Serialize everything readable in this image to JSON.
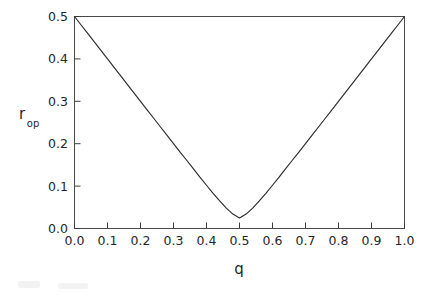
{
  "figure": {
    "background_color": "#ffffff",
    "frame_color": "#4a4a4a",
    "curve_color": "#2b2b2b"
  },
  "chart_data": {
    "type": "line",
    "title": "",
    "subtitle": "",
    "xlabel": "q",
    "ylabel": "r",
    "ylabel_subscript": "op",
    "xlim": [
      0.0,
      1.0
    ],
    "ylim": [
      0.0,
      0.5
    ],
    "grid": false,
    "legend": null,
    "legend_position": "none",
    "xticks": [
      "0.0",
      "0.1",
      "0.2",
      "0.3",
      "0.4",
      "0.5",
      "0.6",
      "0.7",
      "0.8",
      "0.9",
      "1.0"
    ],
    "xtick_values": [
      0.0,
      0.1,
      0.2,
      0.3,
      0.4,
      0.5,
      0.6,
      0.7,
      0.8,
      0.9,
      1.0
    ],
    "yticks": [
      "0.0",
      "0.1",
      "0.2",
      "0.3",
      "0.4",
      "0.5"
    ],
    "ytick_values": [
      0.0,
      0.1,
      0.2,
      0.3,
      0.4,
      0.5
    ],
    "series": [
      {
        "name": "r_op",
        "x": [
          0.0,
          0.02,
          0.04,
          0.06,
          0.08,
          0.1,
          0.12,
          0.14,
          0.16,
          0.18,
          0.2,
          0.22,
          0.24,
          0.26,
          0.28,
          0.3,
          0.32,
          0.34,
          0.36,
          0.38,
          0.4,
          0.42,
          0.44,
          0.46,
          0.48,
          0.5,
          0.52,
          0.54,
          0.56,
          0.58,
          0.6,
          0.62,
          0.64,
          0.66,
          0.68,
          0.7,
          0.72,
          0.74,
          0.76,
          0.78,
          0.8,
          0.82,
          0.84,
          0.86,
          0.88,
          0.9,
          0.92,
          0.94,
          0.96,
          0.98,
          1.0
        ],
        "y": [
          0.5,
          0.48,
          0.46,
          0.44,
          0.42,
          0.4,
          0.38,
          0.36,
          0.34,
          0.32,
          0.3,
          0.28,
          0.26,
          0.24,
          0.22,
          0.2,
          0.18,
          0.161,
          0.141,
          0.121,
          0.102,
          0.083,
          0.065,
          0.048,
          0.034,
          0.025,
          0.034,
          0.048,
          0.065,
          0.083,
          0.102,
          0.121,
          0.141,
          0.161,
          0.18,
          0.2,
          0.22,
          0.24,
          0.26,
          0.28,
          0.3,
          0.32,
          0.34,
          0.36,
          0.38,
          0.4,
          0.42,
          0.44,
          0.46,
          0.48,
          0.5
        ]
      }
    ],
    "annotations": [
      {
        "text": "minimum at q = 0.5",
        "value": 0.0
      }
    ]
  }
}
